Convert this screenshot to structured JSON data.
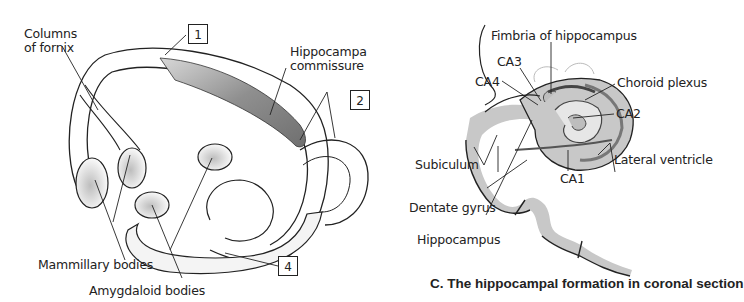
{
  "figure": {
    "panel_left": {
      "labels": {
        "columns_of_fornix_line1": "Columns",
        "columns_of_fornix_line2": "of fornix",
        "hippocampa_commissure_line1": "Hippocampa",
        "hippocampa_commissure_line2": "commissure",
        "mammillary_bodies": "Mammillary bodies",
        "amygdaloid_bodies": "Amygdaloid bodies"
      },
      "numbered_boxes": [
        "1",
        "2",
        "4"
      ]
    },
    "panel_c": {
      "labels": {
        "fimbria": "Fimbria of hippocampus",
        "ca3": "CA3",
        "ca4": "CA4",
        "choroid_plexus": "Choroid plexus",
        "ca2": "CA2",
        "subiculum": "Subiculum",
        "lateral_ventricle": "Lateral ventricle",
        "ca1": "CA1",
        "dentate_gyrus": "Dentate gyrus",
        "hippocampus": "Hippocampus"
      },
      "caption": "C. The hippocampal formation in coronal section"
    },
    "colors": {
      "line": "#222222",
      "tissue_gray": "#c8c8c8",
      "dark_gray": "#8a8a8a",
      "background": "#ffffff"
    }
  }
}
